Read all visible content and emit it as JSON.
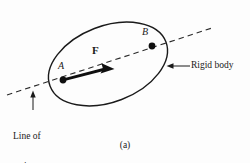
{
  "figure": {
    "caption": "(a)",
    "background_color": "#fdfdfd",
    "stroke_color": "#1a1a1a",
    "labels": {
      "point_a": "A",
      "point_b": "B",
      "force": "F",
      "rigid_body": "Rigid body",
      "line_of_action_1": "Line of",
      "line_of_action_2": "action"
    },
    "geometry": {
      "ellipse": {
        "center_x": 108,
        "center_y": 64,
        "radius_x": 62,
        "radius_y": 38,
        "rotation_deg": -21
      },
      "line_of_action": {
        "x1": 7,
        "y1": 95,
        "x2": 212,
        "y2": 28,
        "dashed": true
      },
      "point_a": {
        "x": 63,
        "y": 80,
        "r": 3.4
      },
      "point_b": {
        "x": 152,
        "y": 46,
        "r": 3.4
      },
      "force_arrow": {
        "x1": 63,
        "y1": 80,
        "x2": 113,
        "y2": 68
      },
      "rigid_body_leader": {
        "x1": 191,
        "y1": 66,
        "x2": 167,
        "y2": 66
      },
      "line_of_action_leader": {
        "x1": 33,
        "y1": 110,
        "x2": 33,
        "y2": 91
      }
    }
  }
}
